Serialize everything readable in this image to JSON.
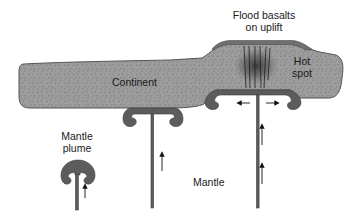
{
  "diagram": {
    "type": "geologic cross-section",
    "labels": {
      "continent": "Continent",
      "flood_basalts_line1": "Flood basalts",
      "flood_basalts_line2": "on uplift",
      "hot_spot_line1": "Hot",
      "hot_spot_line2": "spot",
      "mantle_plume_line1": "Mantle",
      "mantle_plume_line2": "plume",
      "mantle": "Mantle"
    },
    "elements": [
      {
        "id": "continent",
        "description": "Stippled gray continental crust slab"
      },
      {
        "id": "flood-basalts",
        "description": "Dark basalt cap on uplifted crust"
      },
      {
        "id": "hot-spot",
        "description": "Dark zone with vertical dikes in crust"
      },
      {
        "id": "plume-young",
        "description": "Small rising mantle plume with mushroom head"
      },
      {
        "id": "plume-impinging",
        "description": "Plume head flattening beneath continent"
      },
      {
        "id": "plume-spreading",
        "description": "Plume head spreading laterally beneath hot spot"
      }
    ],
    "arrows": {
      "upward_count": 4,
      "lateral_count": 2
    },
    "colors": {
      "crust": "#9a9a9a",
      "plume": "#5e5e5e",
      "basalt": "#6e6e6e",
      "text": "#1a1a1a"
    }
  }
}
